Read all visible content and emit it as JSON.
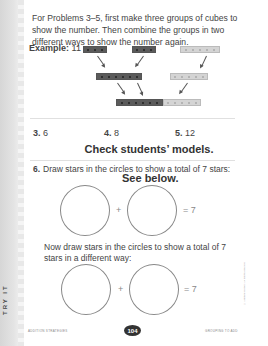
{
  "instructions": "For Problems 3–5, first make three groups of cubes to show the number. Then combine the groups in two different ways to show the number again.",
  "example": {
    "label": "Example:",
    "number": "11",
    "top_groups": [
      3,
      3,
      5
    ],
    "middle_groups": [
      6,
      5
    ],
    "bottom_group": {
      "dark": 6,
      "light": 5
    }
  },
  "problems": [
    {
      "number": "3.",
      "value": "6"
    },
    {
      "number": "4.",
      "value": "8"
    },
    {
      "number": "5.",
      "value": "12"
    }
  ],
  "answer_key_1": "Check students’ models.",
  "question6": {
    "number": "6.",
    "text": "Draw stars in the circles to show a total of 7 stars:",
    "answer": "See below.",
    "plus": "+",
    "equals": "= 7",
    "part2_text": "Now draw stars in the circles to show a total of 7 stars in a different way:"
  },
  "side_tab": "TRY IT",
  "footer": {
    "left": "ADDITION STRATEGIES",
    "page": "104",
    "right": "GROUPING TO ADD"
  },
  "copyright": "© Addison-Wesley. All rights reserved."
}
